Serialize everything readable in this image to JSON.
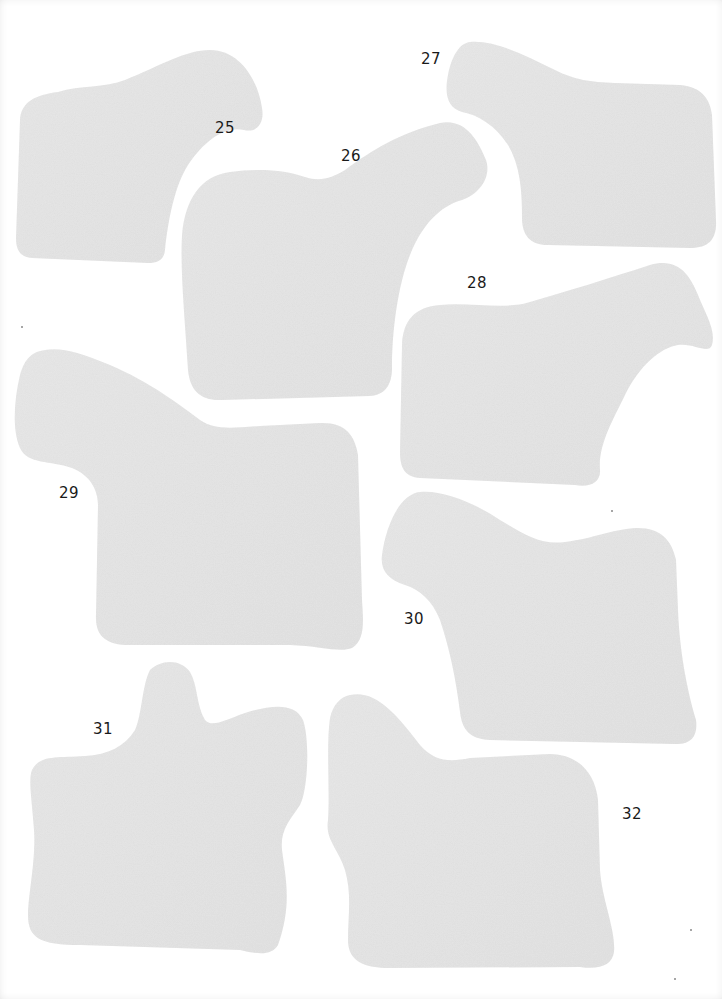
{
  "sheet": {
    "background": "#ffffff",
    "shape_color": "#e5e5e5",
    "pieces": [
      {
        "number": "25",
        "label_pos": [
          215,
          130
        ]
      },
      {
        "number": "26",
        "label_pos": [
          341,
          150
        ]
      },
      {
        "number": "27",
        "label_pos": [
          421,
          53
        ]
      },
      {
        "number": "28",
        "label_pos": [
          467,
          277
        ]
      },
      {
        "number": "29",
        "label_pos": [
          59,
          490
        ]
      },
      {
        "number": "30",
        "label_pos": [
          404,
          613
        ]
      },
      {
        "number": "31",
        "label_pos": [
          93,
          723
        ]
      },
      {
        "number": "32",
        "label_pos": [
          622,
          808
        ]
      }
    ]
  }
}
